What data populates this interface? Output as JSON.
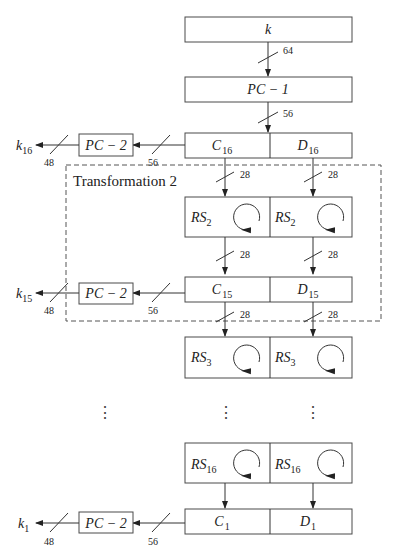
{
  "diagram": {
    "input_key": "k",
    "pc1": "PC − 1",
    "pc2": "PC − 2",
    "transformation_label": "Transformation 2",
    "bit_widths": {
      "key": "64",
      "after_pc1": "56",
      "half": "28",
      "to_pc2": "56",
      "subkey": "48"
    },
    "registers": {
      "c16": {
        "base": "C",
        "sub": "16"
      },
      "d16": {
        "base": "D",
        "sub": "16"
      },
      "c15": {
        "base": "C",
        "sub": "15"
      },
      "d15": {
        "base": "D",
        "sub": "15"
      },
      "c1": {
        "base": "C",
        "sub": "1"
      },
      "d1": {
        "base": "D",
        "sub": "1"
      }
    },
    "rotations": {
      "rs2": {
        "base": "RS",
        "sub": "2"
      },
      "rs3": {
        "base": "RS",
        "sub": "3"
      },
      "rs16": {
        "base": "RS",
        "sub": "16"
      }
    },
    "subkeys": {
      "k16": {
        "base": "k",
        "sub": "16"
      },
      "k15": {
        "base": "k",
        "sub": "15"
      },
      "k1": {
        "base": "k",
        "sub": "1"
      }
    },
    "ellipsis": "⋮"
  }
}
